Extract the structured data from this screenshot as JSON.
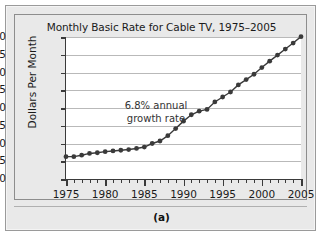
{
  "figure": {
    "caption": "(a)"
  },
  "chart_data": {
    "type": "line",
    "title": "Monthly Basic Rate for Cable TV, 1975–2005",
    "xlabel": "",
    "ylabel": "Dollars Per Month",
    "xlim": [
      1975,
      2005
    ],
    "ylim": [
      0,
      40
    ],
    "grid": "horizontal",
    "legend": "none",
    "ytick_labels": [
      "0",
      "5",
      "10",
      "15",
      "20",
      "25",
      "30",
      "35",
      "40"
    ],
    "yticks": [
      0,
      5,
      10,
      15,
      20,
      25,
      30,
      35,
      40
    ],
    "xtick_labels": [
      "1975",
      "1980",
      "1985",
      "1990",
      "1995",
      "2000",
      "2005"
    ],
    "xticks": [
      1975,
      1980,
      1985,
      1990,
      1995,
      2000,
      2005
    ],
    "xtick_minor_step": 1,
    "marker": "filled-circle",
    "line_color": "#3a3a3a",
    "marker_color": "#3a3a3a",
    "annotations": [
      {
        "text_line1": "6.8% annual",
        "text_line2": "growth rate",
        "x": 1983,
        "y": 22
      }
    ],
    "x": [
      1975,
      1976,
      1977,
      1978,
      1979,
      1980,
      1981,
      1982,
      1983,
      1984,
      1985,
      1986,
      1987,
      1988,
      1989,
      1990,
      1991,
      1992,
      1993,
      1994,
      1995,
      1996,
      1997,
      1998,
      1999,
      2000,
      2001,
      2002,
      2003,
      2004,
      2005
    ],
    "values": [
      6.3,
      6.3,
      6.7,
      7.2,
      7.4,
      7.7,
      7.9,
      8.1,
      8.3,
      8.6,
      9.0,
      10.0,
      10.7,
      12.2,
      14.2,
      16.3,
      18.1,
      19.1,
      19.6,
      21.7,
      23.1,
      24.5,
      26.5,
      28.0,
      29.5,
      31.4,
      33.2,
      34.9,
      36.6,
      38.3,
      40.1
    ]
  }
}
